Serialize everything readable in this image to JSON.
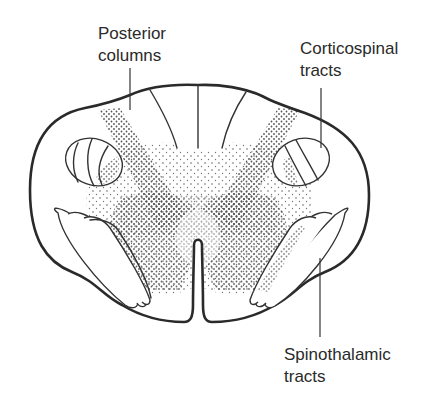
{
  "diagram": {
    "colors": {
      "outline": "#2a2a2a",
      "stipple": "#555555",
      "background": "#ffffff"
    },
    "labels": {
      "posterior_columns": {
        "line1": "Posterior",
        "line2": "columns"
      },
      "corticospinal_tracts": {
        "line1": "Corticospinal",
        "line2": "tracts"
      },
      "spinothalamic_tracts": {
        "line1": "Spinothalamic",
        "line2": "tracts"
      }
    }
  }
}
